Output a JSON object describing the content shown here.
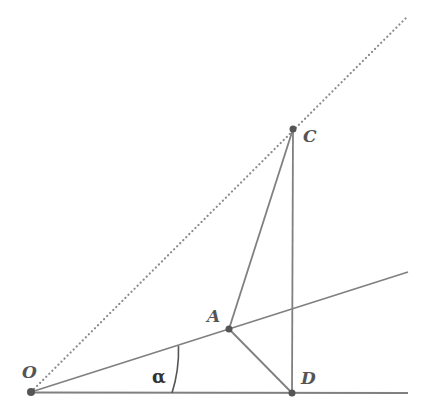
{
  "diagram": {
    "title": "",
    "points": {
      "O": {
        "label": "O",
        "x": 31,
        "y": 392,
        "lx": 22,
        "ly": 378
      },
      "A": {
        "label": "A",
        "x": 229,
        "y": 329,
        "lx": 207,
        "ly": 322
      },
      "C": {
        "label": "C",
        "x": 293,
        "y": 129,
        "lx": 303,
        "ly": 142
      },
      "D": {
        "label": "D",
        "x": 292,
        "y": 393,
        "lx": 301,
        "ly": 384
      }
    },
    "angle": {
      "label": "α",
      "lx": 152,
      "ly": 383
    },
    "colors": {
      "line": "#808080",
      "dot": "#555555",
      "dotted": "#8a8a8a"
    }
  }
}
